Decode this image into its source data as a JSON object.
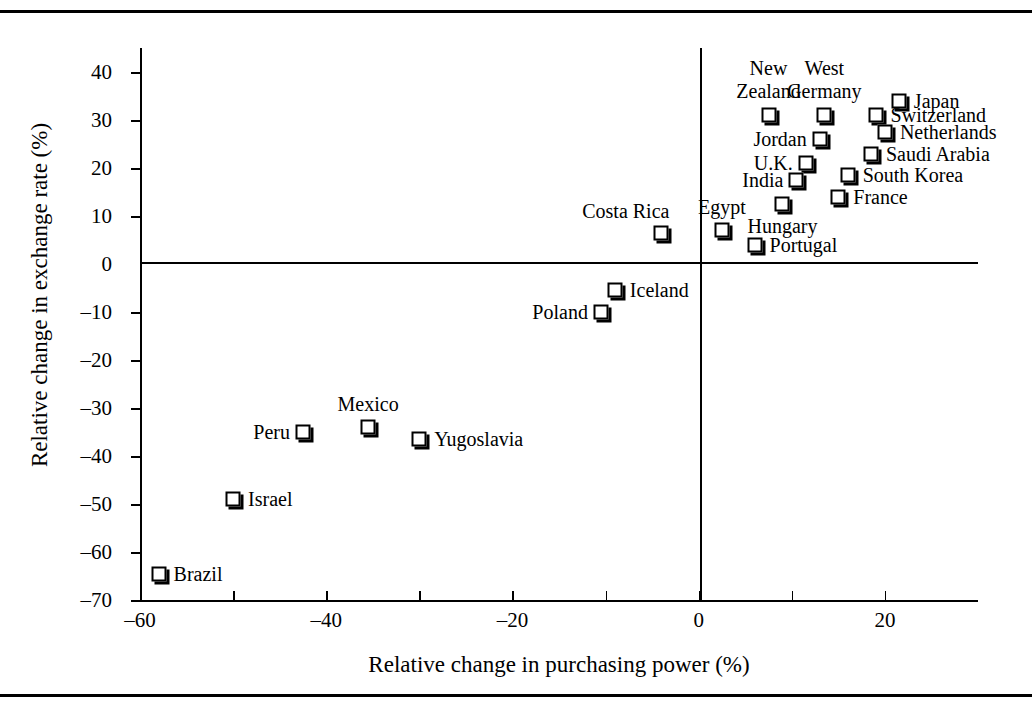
{
  "chart_data": {
    "type": "scatter",
    "title": "",
    "xlabel": "Relative change in purchasing power (%)",
    "ylabel": "Relative change in exchange rate (%)",
    "xlim": [
      -60,
      30
    ],
    "ylim": [
      -70,
      45
    ],
    "xticks": [
      -60,
      -50,
      -40,
      -30,
      -20,
      -10,
      0,
      10,
      20
    ],
    "xtick_labels": [
      "–60",
      "",
      "–40",
      "",
      "–20",
      "",
      "0",
      "",
      "20"
    ],
    "yticks": [
      40,
      30,
      20,
      10,
      0,
      -10,
      -20,
      -30,
      -40,
      -50,
      -60,
      -70
    ],
    "ytick_labels": [
      "40",
      "30",
      "20",
      "10",
      "0",
      "–10",
      "–20",
      "–30",
      "–40",
      "–50",
      "–60",
      "–70"
    ],
    "grid": false,
    "legend": "none",
    "reference_lines": [
      {
        "axis": "y",
        "value": 0
      },
      {
        "axis": "x",
        "value": 0
      }
    ],
    "points": [
      {
        "name": "Japan",
        "x": 21.5,
        "y": 34.0,
        "label_pos": "right"
      },
      {
        "name": "Switzerland",
        "x": 19.0,
        "y": 31.0,
        "label_pos": "right"
      },
      {
        "name": "Netherlands",
        "x": 20.0,
        "y": 27.5,
        "label_pos": "right"
      },
      {
        "name": "Saudi Arabia",
        "x": 18.5,
        "y": 23.0,
        "label_pos": "right"
      },
      {
        "name": "South Korea",
        "x": 16.0,
        "y": 18.5,
        "label_pos": "right"
      },
      {
        "name": "France",
        "x": 15.0,
        "y": 14.0,
        "label_pos": "right"
      },
      {
        "name": "West Germany",
        "x": 13.5,
        "y": 31.0,
        "label_pos": "above"
      },
      {
        "name": "New Zealand",
        "x": 7.5,
        "y": 31.0,
        "label_pos": "above"
      },
      {
        "name": "Jordan",
        "x": 13.0,
        "y": 26.0,
        "label_pos": "left"
      },
      {
        "name": "U.K.",
        "x": 11.5,
        "y": 21.0,
        "label_pos": "left"
      },
      {
        "name": "India",
        "x": 10.5,
        "y": 17.5,
        "label_pos": "left"
      },
      {
        "name": "Hungary",
        "x": 9.0,
        "y": 12.5,
        "label_pos": "below"
      },
      {
        "name": "Egypt",
        "x": 2.5,
        "y": 7.0,
        "label_pos": "above"
      },
      {
        "name": "Portugal",
        "x": 6.0,
        "y": 4.0,
        "label_pos": "right"
      },
      {
        "name": "Costa Rica",
        "x": -4.0,
        "y": 6.5,
        "label_pos": "above-left"
      },
      {
        "name": "Iceland",
        "x": -9.0,
        "y": -5.5,
        "label_pos": "right"
      },
      {
        "name": "Poland",
        "x": -10.5,
        "y": -10.0,
        "label_pos": "left"
      },
      {
        "name": "Mexico",
        "x": -35.5,
        "y": -34.0,
        "label_pos": "above"
      },
      {
        "name": "Peru",
        "x": -42.5,
        "y": -35.0,
        "label_pos": "left"
      },
      {
        "name": "Yugoslavia",
        "x": -30.0,
        "y": -36.5,
        "label_pos": "right"
      },
      {
        "name": "Israel",
        "x": -50.0,
        "y": -49.0,
        "label_pos": "right"
      },
      {
        "name": "Brazil",
        "x": -58.0,
        "y": -64.5,
        "label_pos": "right"
      }
    ]
  }
}
